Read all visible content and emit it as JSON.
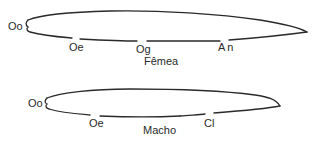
{
  "female": {
    "caption": "Fêmea",
    "labels": {
      "oo": "Oo",
      "oe": "Oe",
      "og": "Og",
      "an": "An"
    }
  },
  "male": {
    "caption": "Macho",
    "labels": {
      "oo": "Oo",
      "oe": "Oe",
      "cl": "Cl"
    }
  },
  "colors": {
    "outline": "#2a2a2a",
    "background": "#ffffff"
  }
}
